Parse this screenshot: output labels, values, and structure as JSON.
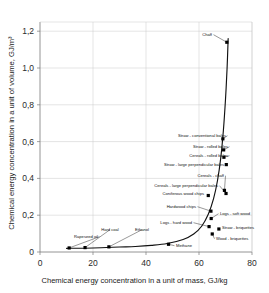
{
  "chart_data": {
    "type": "scatter",
    "title": "",
    "xlabel": "Chemical energy concentration in a unit of mass, GJ/kg",
    "ylabel": "Chemical energy concentration in a unit of volume, GJ/m³",
    "xlim": [
      0,
      80
    ],
    "ylim": [
      0,
      1.25
    ],
    "xticks": [
      "0",
      "20",
      "40",
      "60",
      "80"
    ],
    "xtick_values": [
      0,
      20,
      40,
      60,
      80
    ],
    "yticks": [
      "0",
      "0,2",
      "0,4",
      "0,6",
      "0,8",
      "1,0",
      "1,2"
    ],
    "ytick_values": [
      0,
      0.2,
      0.4,
      0.6,
      0.8,
      1.0,
      1.2
    ],
    "grid": true,
    "legend": "none",
    "decimal_separator": "comma",
    "points": [
      {
        "label": "Chaff",
        "x": 70.5,
        "y": 1.14,
        "side": "left"
      },
      {
        "label": "Straw - conventional bales",
        "x": 69.0,
        "y": 0.615,
        "side": "left"
      },
      {
        "label": "Straw - rolled bales",
        "x": 69.3,
        "y": 0.555,
        "side": "left"
      },
      {
        "label": "Cereals - rolled bales",
        "x": 69.4,
        "y": 0.515,
        "side": "left"
      },
      {
        "label": "Straw - large perpendicular bales",
        "x": 70.3,
        "y": 0.475,
        "side": "left"
      },
      {
        "label": "Cereals - chaff",
        "x": 69.6,
        "y": 0.335,
        "side": "left"
      },
      {
        "label": "Cereals - large perpendicular bales",
        "x": 70.2,
        "y": 0.318,
        "side": "left"
      },
      {
        "label": "Coniferous wood chips",
        "x": 63.5,
        "y": 0.307,
        "side": "left"
      },
      {
        "label": "Hardwood chips",
        "x": 64.5,
        "y": 0.222,
        "side": "left"
      },
      {
        "label": "Logs - soft wood",
        "x": 64.6,
        "y": 0.182,
        "side": "right"
      },
      {
        "label": "Logs - hard wood",
        "x": 63.8,
        "y": 0.138,
        "side": "left"
      },
      {
        "label": "Straw - briquettes",
        "x": 67.5,
        "y": 0.125,
        "side": "right"
      },
      {
        "label": "Wood - briquettes",
        "x": 65.0,
        "y": 0.098,
        "side": "right"
      },
      {
        "label": "Rapeseed oil",
        "x": 11.0,
        "y": 0.022,
        "side": "above-left"
      },
      {
        "label": "Hard coal",
        "x": 17.0,
        "y": 0.024,
        "side": "above"
      },
      {
        "label": "Ethanol",
        "x": 26.0,
        "y": 0.028,
        "side": "above"
      },
      {
        "label": "Methane",
        "x": 48.5,
        "y": 0.042,
        "side": "right"
      }
    ],
    "curve": [
      {
        "x": 10.0,
        "y": 0.02
      },
      {
        "x": 20.0,
        "y": 0.022
      },
      {
        "x": 30.0,
        "y": 0.027
      },
      {
        "x": 36.0,
        "y": 0.03
      },
      {
        "x": 42.0,
        "y": 0.036
      },
      {
        "x": 48.0,
        "y": 0.046
      },
      {
        "x": 54.0,
        "y": 0.068
      },
      {
        "x": 58.0,
        "y": 0.098
      },
      {
        "x": 61.0,
        "y": 0.14
      },
      {
        "x": 63.5,
        "y": 0.205
      },
      {
        "x": 65.5,
        "y": 0.29
      },
      {
        "x": 67.0,
        "y": 0.39
      },
      {
        "x": 68.2,
        "y": 0.51
      },
      {
        "x": 69.2,
        "y": 0.66
      },
      {
        "x": 70.0,
        "y": 0.83
      },
      {
        "x": 70.6,
        "y": 1.0
      },
      {
        "x": 71.0,
        "y": 1.16
      }
    ]
  },
  "colors": {
    "background": "#ffffff",
    "axis": "#7a7a7a",
    "grid": "#c9c9c9",
    "curve": "#111111",
    "marker": "#000000",
    "text": "#1a1a1a"
  }
}
